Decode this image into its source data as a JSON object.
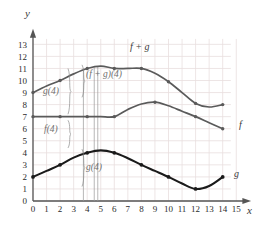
{
  "chart_data": {
    "type": "line",
    "title": "",
    "xlabel": "x",
    "ylabel": "y",
    "xlim": [
      0,
      15
    ],
    "ylim": [
      0,
      13.6
    ],
    "grid": true,
    "legend": "inline-curve-labels",
    "xticks": [
      "0",
      "1",
      "2",
      "3",
      "4",
      "5",
      "6",
      "7",
      "8",
      "9",
      "10",
      "11",
      "12",
      "13",
      "14",
      "15"
    ],
    "yticks": [
      "0",
      "1",
      "2",
      "3",
      "4",
      "5",
      "6",
      "7",
      "8",
      "9",
      "10",
      "11",
      "12",
      "13"
    ],
    "series": [
      {
        "name": "f + g",
        "label": "f + g",
        "color": "#5a5a5a",
        "marked_points": [
          [
            0,
            9
          ],
          [
            2,
            10
          ],
          [
            4,
            11
          ],
          [
            6,
            11
          ],
          [
            8,
            11
          ],
          [
            10,
            9.9
          ],
          [
            12,
            8.1
          ],
          [
            14,
            8.0
          ]
        ],
        "x": [
          0,
          1,
          2,
          3,
          4,
          5,
          6,
          7,
          8,
          9,
          10,
          11,
          12,
          13,
          14
        ],
        "values": [
          9,
          9.55,
          10,
          10.55,
          11,
          11.2,
          11,
          11,
          11,
          10.6,
          9.9,
          9.0,
          8.1,
          7.8,
          8.0
        ]
      },
      {
        "name": "f",
        "label": "f",
        "color": "#5a5a5a",
        "marked_points": [
          [
            0,
            7
          ],
          [
            2,
            7
          ],
          [
            4,
            7
          ],
          [
            6,
            7
          ],
          [
            9,
            8.2
          ],
          [
            12,
            7.0
          ],
          [
            14,
            6.0
          ]
        ],
        "x": [
          0,
          1,
          2,
          3,
          4,
          5,
          6,
          7,
          8,
          9,
          10,
          11,
          12,
          13,
          14
        ],
        "values": [
          7,
          7,
          7,
          7,
          7,
          7,
          7,
          7.6,
          8.05,
          8.2,
          7.9,
          7.45,
          7.0,
          6.5,
          6.0
        ]
      },
      {
        "name": "g",
        "label": "g",
        "color": "#1a1a1a",
        "marked_points": [
          [
            0,
            2
          ],
          [
            2,
            3
          ],
          [
            4,
            4
          ],
          [
            6,
            4
          ],
          [
            8,
            3
          ],
          [
            10,
            2
          ],
          [
            12,
            1
          ],
          [
            14,
            2
          ]
        ],
        "x": [
          0,
          1,
          2,
          3,
          4,
          5,
          6,
          7,
          8,
          9,
          10,
          11,
          12,
          13,
          14
        ],
        "values": [
          2,
          2.5,
          3,
          3.6,
          4,
          4.2,
          4,
          3.55,
          3,
          2.5,
          2,
          1.45,
          1,
          1.25,
          2
        ]
      }
    ],
    "annotations": [
      {
        "id": "g4",
        "text": "g(4)",
        "value": 4,
        "x": 4,
        "span": [
          7,
          11
        ],
        "brace": true
      },
      {
        "id": "f4",
        "text": "f(4)",
        "value": 7,
        "x": 4,
        "span": [
          0,
          7
        ],
        "brace": true
      },
      {
        "id": "fg4",
        "text": "(f + g)(4)",
        "value": 11,
        "x": 4,
        "span": [
          0,
          11
        ],
        "brace": true
      },
      {
        "id": "g4b",
        "text": "g(4)",
        "value": 4,
        "x": 4,
        "span": [
          0,
          4
        ],
        "brace": true
      }
    ],
    "vertical_measure_lines": [
      {
        "x": 3.72,
        "from": 0,
        "to": 11.0
      },
      {
        "x": 4.52,
        "from": 0,
        "to": 11.1
      },
      {
        "x": 4.78,
        "from": 0,
        "to": 11.15
      }
    ],
    "colors": {
      "grid": "#e8dede",
      "axis": "#555555",
      "fg_curve": "#5a5a5a",
      "f_curve": "#5a5a5a",
      "g_curve": "#1a1a1a",
      "annotation": "#6f6f6f",
      "background": "#ffffff"
    }
  },
  "labels": {
    "axis_x": "x",
    "axis_y": "y",
    "curve_fg": "f + g",
    "curve_f": "f",
    "curve_g": "g",
    "annot_g4_top": "g(4)",
    "annot_f4": "f(4)",
    "annot_fg4": "(f + g)(4)",
    "annot_g4_bottom": "g(4)"
  }
}
